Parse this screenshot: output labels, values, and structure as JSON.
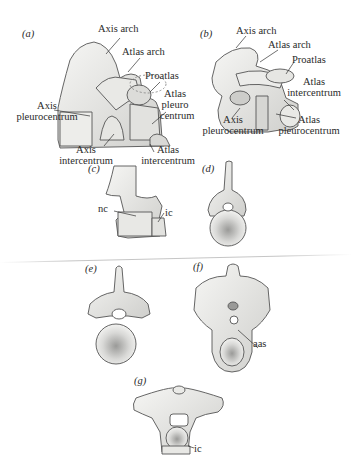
{
  "figure": {
    "panels": [
      {
        "id": "a",
        "label": "(a)",
        "labels": [
          "Axis arch",
          "Atlas arch",
          "Proatlas",
          "Atlas pleuro centrum",
          "Axis pleurocentrum",
          "Axis intercentrum",
          "Atlas intercentrum"
        ]
      },
      {
        "id": "b",
        "label": "(b)",
        "labels": [
          "Axis arch",
          "Atlas arch",
          "Proatlas",
          "Atlas intercentrum",
          "Axis pleurocentrum",
          "Atlas pleurocentrum"
        ]
      },
      {
        "id": "c",
        "label": "(c)",
        "labels": [
          "nc",
          "ic"
        ]
      },
      {
        "id": "d",
        "label": "(d)",
        "labels": []
      },
      {
        "id": "e",
        "label": "(e)",
        "labels": []
      },
      {
        "id": "f",
        "label": "(f)",
        "labels": [
          "aas"
        ]
      },
      {
        "id": "g",
        "label": "(g)",
        "labels": [
          "ic"
        ]
      }
    ]
  },
  "a": {
    "tag": "(a)",
    "axis_arch": "Axis arch",
    "atlas_arch": "Atlas arch",
    "proatlas": "Proatlas",
    "atlas_pleuro_1": "Atlas",
    "atlas_pleuro_2": "pleuro",
    "atlas_pleuro_3": "centrum",
    "axis_pleuro_1": "Axis",
    "axis_pleuro_2": "pleurocentrum",
    "axis_inter_1": "Axis",
    "axis_inter_2": "intercentrum",
    "atlas_inter_1": "Atlas",
    "atlas_inter_2": "intercentrum"
  },
  "b": {
    "tag": "(b)",
    "axis_arch": "Axis arch",
    "atlas_arch": "Atlas arch",
    "proatlas": "Proatlas",
    "atlas_inter_1": "Atlas",
    "atlas_inter_2": "intercentrum",
    "axis_pleuro_1": "Axis",
    "axis_pleuro_2": "pleurocentrum",
    "atlas_pleuro_1": "Atlas",
    "atlas_pleuro_2": "pleurocentrum"
  },
  "c": {
    "tag": "(c)",
    "nc": "nc",
    "ic": "ic"
  },
  "d": {
    "tag": "(d)"
  },
  "e": {
    "tag": "(e)"
  },
  "f": {
    "tag": "(f)",
    "aas": "aas"
  },
  "g": {
    "tag": "(g)",
    "ic": "ic"
  },
  "colors": {
    "ink": "#2a2a2a",
    "bone_light": "#f4f4f2",
    "bone_shade": "#c9c9c6",
    "line": "#555555"
  }
}
